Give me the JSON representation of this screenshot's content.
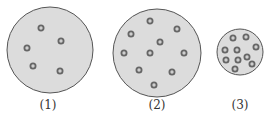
{
  "colors": {
    "fill": "#dcdcdc",
    "stroke": "#555555",
    "particle_ring": "#666666",
    "particle_center": "#cfcfcf"
  },
  "containers": [
    {
      "label": "(1)",
      "cx": 50,
      "cy": 50,
      "r": 43,
      "particles": [
        [
          41,
          28
        ],
        [
          61,
          41
        ],
        [
          27,
          48
        ],
        [
          33,
          66
        ],
        [
          60,
          71
        ]
      ]
    },
    {
      "label": "(2)",
      "cx": 157,
      "cy": 53,
      "r": 44,
      "particles": [
        [
          150,
          21
        ],
        [
          131,
          34
        ],
        [
          177,
          29
        ],
        [
          160,
          42
        ],
        [
          124,
          53
        ],
        [
          150,
          53
        ],
        [
          184,
          53
        ],
        [
          139,
          70
        ],
        [
          172,
          72
        ],
        [
          154,
          85
        ]
      ]
    },
    {
      "label": "(3)",
      "cx": 240,
      "cy": 52,
      "r": 23,
      "particles": [
        [
          233,
          38
        ],
        [
          246,
          37
        ],
        [
          256,
          47
        ],
        [
          225,
          50
        ],
        [
          237,
          50
        ],
        [
          247,
          57
        ],
        [
          226,
          60
        ],
        [
          238,
          60
        ],
        [
          252,
          64
        ],
        [
          235,
          69
        ]
      ]
    }
  ]
}
